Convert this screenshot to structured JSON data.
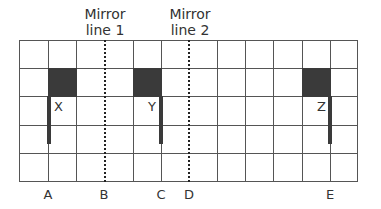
{
  "mirror_lines": [
    {
      "label": "Mirror\nline 1",
      "line1": "Mirror",
      "line2": "line 1"
    },
    {
      "label": "Mirror\nline 2",
      "line1": "Mirror",
      "line2": "line 2"
    }
  ],
  "flags": [
    {
      "label": "X"
    },
    {
      "label": "Y"
    },
    {
      "label": "Z"
    }
  ],
  "bottom_labels": [
    "A",
    "B",
    "C",
    "D",
    "E"
  ],
  "grid": {
    "columns": 12,
    "rows": 5
  },
  "colors": {
    "flag": "#3a3a3a",
    "grid": "#555555"
  }
}
